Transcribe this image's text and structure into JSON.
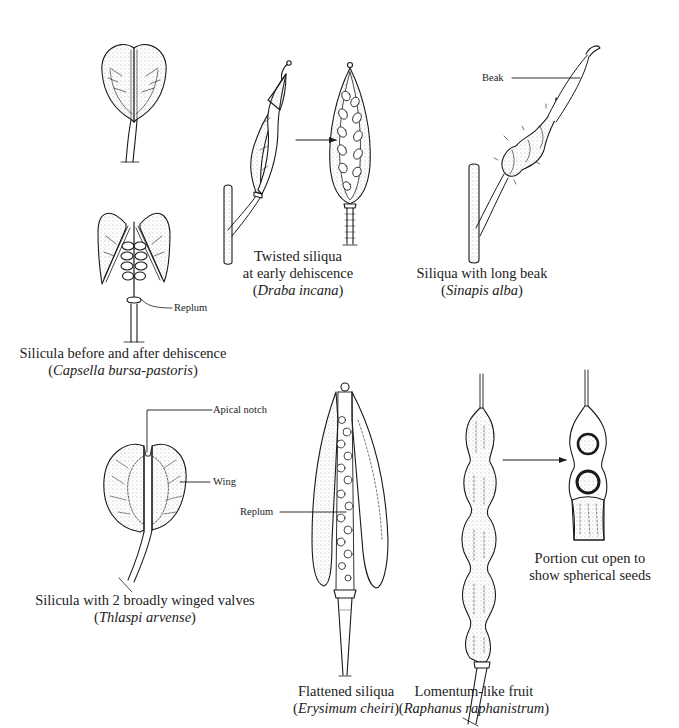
{
  "figure": {
    "panels": [
      {
        "id": "capsella",
        "caption_line1": "Silicula before and after dehiscence",
        "caption_species": "Capsella bursa-pastoris",
        "labels": [
          "Replum"
        ]
      },
      {
        "id": "draba",
        "caption_line1": "Twisted siliqua",
        "caption_line2": "at early dehiscence",
        "caption_species": "Draba incana",
        "labels": []
      },
      {
        "id": "sinapis",
        "caption_line1": "Siliqua with long beak",
        "caption_species": "Sinapis alba",
        "labels": [
          "Beak"
        ]
      },
      {
        "id": "thlaspi",
        "caption_line1": "Silicula with 2 broadly winged valves",
        "caption_species": "Thlaspi arvense",
        "labels": [
          "Apical notch",
          "Wing"
        ]
      },
      {
        "id": "erysimum",
        "caption_line1": "Flattened siliqua",
        "caption_species": "Erysimum cheiri",
        "labels": [
          "Replum"
        ]
      },
      {
        "id": "raphanus",
        "caption_line1": "Lomentum-like fruit",
        "caption_species": "Raphanus raphanistrum",
        "labels": []
      },
      {
        "id": "raphanus-cut",
        "caption_line1": "Portion cut open to",
        "caption_line2": "show spherical seeds",
        "labels": []
      }
    ],
    "colors": {
      "ink": "#1a1a1a",
      "background": "#ffffff"
    }
  }
}
